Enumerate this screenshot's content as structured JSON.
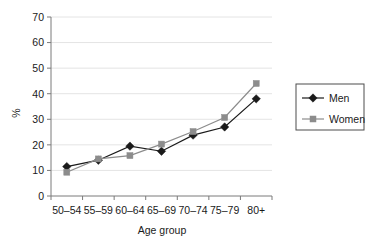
{
  "chart_data": {
    "type": "line",
    "title": "",
    "xlabel": "Age group",
    "ylabel": "%",
    "categories": [
      "50–54",
      "55–59",
      "60–64",
      "65–69",
      "70–74",
      "75–79",
      "80+"
    ],
    "series": [
      {
        "name": "Men",
        "values": [
          11.5,
          14.0,
          19.5,
          17.5,
          23.8,
          27.0,
          38.0
        ],
        "color": "#1a1a1a",
        "marker": "diamond"
      },
      {
        "name": "Women",
        "values": [
          9.3,
          14.5,
          15.8,
          20.3,
          25.2,
          30.7,
          44.0
        ],
        "color": "#8c8c8c",
        "marker": "square"
      }
    ],
    "ylim": [
      0,
      70
    ],
    "yticks": [
      0,
      10,
      20,
      30,
      40,
      50,
      60,
      70
    ],
    "ytick_labels": [
      "0",
      "10",
      "20",
      "30",
      "40",
      "50",
      "60",
      "70"
    ],
    "grid": "horizontal",
    "grid_color": "#e4e4e4",
    "axis_color": "#7a7a7a",
    "legend_position": "right",
    "legend_entries": [
      "Men",
      "Women"
    ],
    "background": "#ffffff"
  },
  "axes": {
    "y_title": "%",
    "x_title": "Age group"
  },
  "legend": {
    "items": [
      {
        "label": "Men"
      },
      {
        "label": "Women"
      }
    ]
  }
}
